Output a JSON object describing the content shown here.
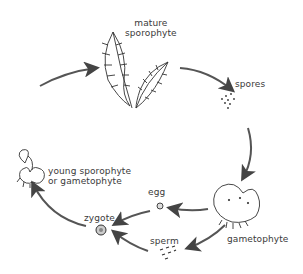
{
  "stages": {
    "mature_sporophyte": {
      "line1": "mature",
      "line2": "sporophyte"
    },
    "spores": "spores",
    "gametophyte": "gametophyte",
    "egg": "egg",
    "sperm": "sperm",
    "zygote": "zygote",
    "young_sporophyte": {
      "line1": "young sporophyte",
      "line2": "or gametophyte"
    }
  },
  "cycle_order": [
    "mature sporophyte",
    "spores",
    "gametophyte",
    "egg",
    "sperm",
    "zygote",
    "young sporophyte on gametophyte"
  ],
  "colors": {
    "ink": "#3a3a3a",
    "arrow": "#444444",
    "background": "#ffffff"
  }
}
